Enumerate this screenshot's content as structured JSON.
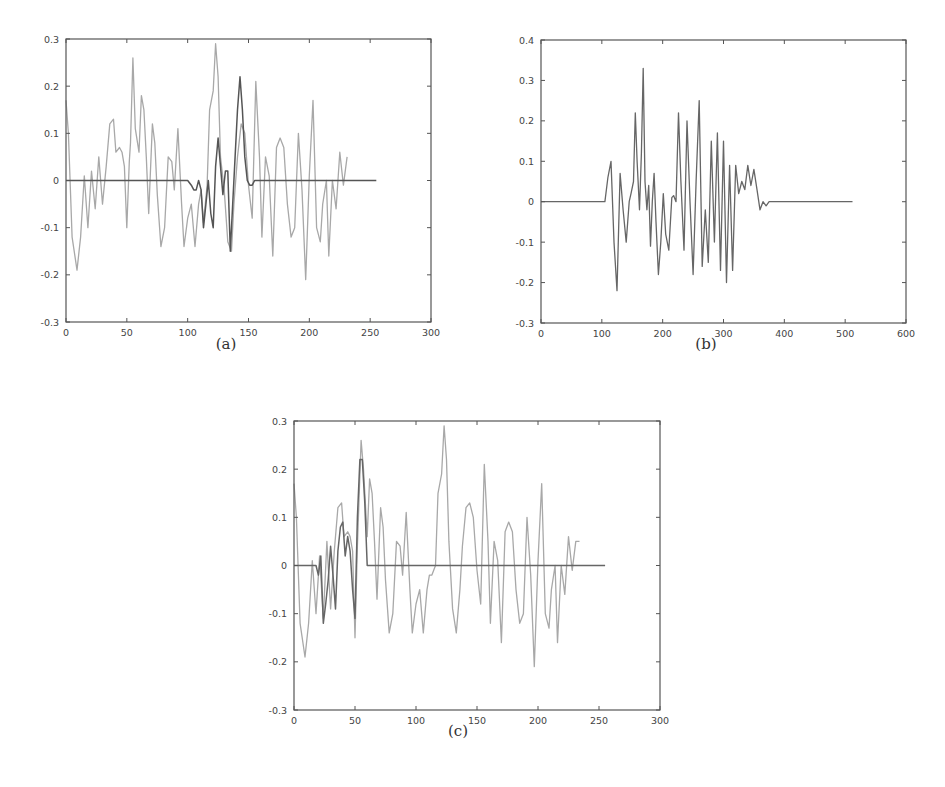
{
  "figure": {
    "panels": [
      {
        "id": "a",
        "caption": "(a)"
      },
      {
        "id": "b",
        "caption": "(b)"
      },
      {
        "id": "c",
        "caption": "(c)"
      }
    ]
  },
  "chart_data": [
    {
      "type": "line",
      "title": "",
      "caption": "(a)",
      "xlabel": "",
      "ylabel": "",
      "xlim": [
        0,
        300
      ],
      "ylim": [
        -0.3,
        0.3
      ],
      "xticks": [
        0,
        50,
        100,
        150,
        200,
        250,
        300
      ],
      "yticks": [
        -0.3,
        -0.2,
        -0.1,
        0,
        0.1,
        0.2,
        0.3
      ],
      "grid": false,
      "legend": null,
      "series": [
        {
          "name": "signal (light)",
          "color": "#a8a8a8",
          "x": [
            0,
            2,
            5,
            9,
            12,
            15,
            18,
            21,
            24,
            27,
            30,
            33,
            36,
            39,
            41,
            44,
            46,
            48,
            50,
            52,
            53,
            55,
            57,
            60,
            62,
            64,
            66,
            68,
            71,
            73,
            75,
            78,
            81,
            84,
            87,
            89,
            92,
            95,
            97,
            100,
            103,
            106,
            109,
            111,
            113,
            116,
            118,
            121,
            123,
            125,
            127,
            130,
            133,
            136,
            138,
            141,
            144,
            147,
            150,
            153,
            156,
            159,
            161,
            164,
            167,
            170,
            173,
            176,
            179,
            182,
            185,
            188,
            191,
            194,
            197,
            200,
            203,
            206,
            209,
            211,
            214,
            216,
            219,
            222,
            225,
            228,
            231,
            234,
            237,
            240,
            243,
            245,
            247,
            249,
            251,
            253,
            255
          ],
          "y": [
            0.17,
            0.1,
            -0.12,
            -0.19,
            -0.12,
            0.01,
            -0.1,
            0.02,
            -0.06,
            0.05,
            -0.05,
            0.03,
            0.12,
            0.13,
            0.06,
            0.07,
            0.06,
            0.03,
            -0.1,
            0.04,
            0.08,
            0.26,
            0.11,
            0.06,
            0.18,
            0.15,
            0.05,
            -0.07,
            0.12,
            0.08,
            -0.03,
            -0.14,
            -0.1,
            0.05,
            0.04,
            -0.02,
            0.11,
            -0.05,
            -0.14,
            -0.08,
            -0.05,
            -0.14,
            -0.05,
            -0.02,
            -0.09,
            -0.01,
            0.15,
            0.19,
            0.29,
            0.22,
            0.05,
            -0.02,
            -0.13,
            -0.15,
            -0.05,
            0.05,
            0.12,
            0.1,
            -0.01,
            -0.08,
            0.21,
            0.05,
            -0.12,
            0.05,
            0.01,
            -0.16,
            0.07,
            0.09,
            0.07,
            -0.05,
            -0.12,
            -0.1,
            0.1,
            -0.02,
            -0.21,
            0.01,
            0.17,
            -0.1,
            -0.13,
            -0.05,
            0.0,
            -0.16,
            0.0,
            -0.06,
            0.06,
            -0.01,
            0.05
          ],
          "note": "values approximate, read from plot"
        },
        {
          "name": "signal (dark)",
          "color": "#555555",
          "x": [
            0,
            100,
            103,
            105,
            107,
            109,
            111,
            113,
            115,
            117,
            119,
            121,
            123,
            125,
            127,
            129,
            131,
            133,
            135,
            137,
            139,
            141,
            143,
            145,
            147,
            149,
            151,
            153,
            155,
            160,
            200,
            255
          ],
          "y": [
            0.0,
            0.0,
            -0.01,
            -0.02,
            -0.02,
            0.0,
            -0.02,
            -0.1,
            -0.05,
            0.0,
            -0.07,
            -0.1,
            0.03,
            0.09,
            0.03,
            -0.03,
            0.02,
            0.02,
            -0.15,
            -0.05,
            0.05,
            0.15,
            0.22,
            0.15,
            0.05,
            0.0,
            -0.01,
            -0.01,
            0.0,
            0.0,
            0.0,
            0.0
          ],
          "note": "flat near 0 except burst around 105-155"
        }
      ]
    },
    {
      "type": "line",
      "title": "",
      "caption": "(b)",
      "xlabel": "",
      "ylabel": "",
      "xlim": [
        0,
        600
      ],
      "ylim": [
        -0.3,
        0.4
      ],
      "xticks": [
        0,
        100,
        200,
        300,
        400,
        500,
        600
      ],
      "yticks": [
        -0.3,
        -0.2,
        -0.1,
        0,
        0.1,
        0.2,
        0.3,
        0.4
      ],
      "grid": false,
      "legend": null,
      "series": [
        {
          "name": "signal",
          "color": "#666666",
          "x": [
            0,
            105,
            110,
            115,
            120,
            125,
            130,
            135,
            140,
            145,
            148,
            152,
            155,
            158,
            162,
            165,
            168,
            171,
            174,
            177,
            180,
            183,
            186,
            189,
            193,
            197,
            201,
            205,
            210,
            215,
            218,
            222,
            226,
            230,
            235,
            240,
            245,
            250,
            255,
            260,
            265,
            270,
            275,
            280,
            285,
            290,
            295,
            300,
            305,
            310,
            315,
            320,
            325,
            330,
            335,
            340,
            345,
            350,
            355,
            360,
            365,
            370,
            375,
            380,
            385,
            390,
            395,
            400,
            410,
            512
          ],
          "y": [
            0.0,
            0.0,
            0.06,
            0.1,
            -0.1,
            -0.22,
            0.07,
            -0.02,
            -0.1,
            0.0,
            0.02,
            0.05,
            0.22,
            0.1,
            -0.02,
            0.12,
            0.33,
            0.05,
            -0.02,
            0.04,
            -0.11,
            0.0,
            0.07,
            -0.05,
            -0.18,
            -0.1,
            0.02,
            -0.08,
            -0.12,
            0.01,
            0.015,
            0.0,
            0.22,
            0.05,
            -0.12,
            0.2,
            0.0,
            -0.18,
            0.05,
            0.25,
            -0.16,
            -0.02,
            -0.15,
            0.15,
            -0.1,
            0.17,
            -0.17,
            0.15,
            -0.2,
            0.09,
            -0.17,
            0.09,
            0.02,
            0.05,
            0.03,
            0.09,
            0.04,
            0.08,
            0.03,
            -0.02,
            0.0,
            -0.01,
            0.0,
            0.0,
            0.0,
            0.0,
            0.0,
            0.0,
            0.0,
            0.0
          ],
          "note": "values approximate; silence from 0-105 and 400-512"
        }
      ]
    },
    {
      "type": "line",
      "title": "",
      "caption": "(c)",
      "xlabel": "",
      "ylabel": "",
      "xlim": [
        0,
        300
      ],
      "ylim": [
        -0.3,
        0.3
      ],
      "xticks": [
        0,
        50,
        100,
        150,
        200,
        250,
        300
      ],
      "yticks": [
        -0.3,
        -0.2,
        -0.1,
        0,
        0.1,
        0.2,
        0.3
      ],
      "grid": false,
      "legend": null,
      "series": [
        {
          "name": "signal (light)",
          "color": "#a8a8a8",
          "x": [
            0,
            2,
            5,
            9,
            12,
            15,
            18,
            21,
            24,
            27,
            30,
            33,
            36,
            39,
            41,
            44,
            46,
            48,
            50,
            52,
            55,
            57,
            60,
            62,
            64,
            66,
            68,
            71,
            73,
            75,
            78,
            81,
            84,
            87,
            89,
            92,
            95,
            97,
            100,
            103,
            106,
            109,
            111,
            113,
            116,
            118,
            121,
            123,
            125,
            127,
            130,
            133,
            136,
            138,
            141,
            144,
            147,
            150,
            153,
            156,
            159,
            161,
            164,
            167,
            170,
            173,
            176,
            179,
            182,
            185,
            188,
            191,
            194,
            197,
            200,
            203,
            206,
            209,
            211,
            214,
            216,
            219,
            222,
            225,
            228,
            231,
            234,
            237,
            240,
            243,
            245,
            247,
            249,
            251,
            253,
            255
          ],
          "y": [
            0.17,
            0.1,
            -0.12,
            -0.19,
            -0.12,
            0.01,
            -0.1,
            0.02,
            -0.11,
            0.05,
            -0.09,
            0.03,
            0.12,
            0.13,
            0.06,
            0.07,
            0.06,
            0.03,
            -0.15,
            0.04,
            0.26,
            0.2,
            0.06,
            0.18,
            0.15,
            0.05,
            -0.07,
            0.12,
            0.08,
            -0.03,
            -0.14,
            -0.1,
            0.05,
            0.04,
            -0.02,
            0.11,
            -0.05,
            -0.14,
            -0.08,
            -0.05,
            -0.14,
            -0.05,
            -0.02,
            -0.02,
            0.0,
            0.15,
            0.19,
            0.29,
            0.22,
            0.05,
            -0.09,
            -0.14,
            -0.05,
            0.04,
            0.12,
            0.13,
            0.1,
            -0.01,
            -0.08,
            0.21,
            0.05,
            -0.12,
            0.05,
            0.01,
            -0.16,
            0.07,
            0.09,
            0.07,
            -0.05,
            -0.12,
            -0.1,
            0.1,
            -0.02,
            -0.21,
            0.01,
            0.17,
            -0.1,
            -0.13,
            -0.05,
            0.0,
            -0.16,
            0.0,
            -0.06,
            0.06,
            -0.01,
            0.05,
            0.05
          ],
          "note": "values approximate"
        },
        {
          "name": "signal (dark, overlay)",
          "color": "#666666",
          "x": [
            0,
            18,
            20,
            22,
            24,
            26,
            28,
            30,
            32,
            34,
            36,
            38,
            40,
            42,
            44,
            46,
            48,
            50,
            52,
            54,
            56,
            58,
            60,
            62,
            100,
            255
          ],
          "y": [
            0.0,
            0.0,
            -0.02,
            0.02,
            -0.12,
            -0.08,
            -0.03,
            0.04,
            -0.02,
            -0.09,
            0.03,
            0.08,
            0.09,
            0.02,
            0.06,
            0.03,
            -0.05,
            -0.11,
            0.1,
            0.22,
            0.22,
            0.13,
            0.0,
            0.0,
            0.0,
            0.0
          ],
          "note": "overlaps first ~60 samples, then flat at 0"
        }
      ]
    }
  ]
}
